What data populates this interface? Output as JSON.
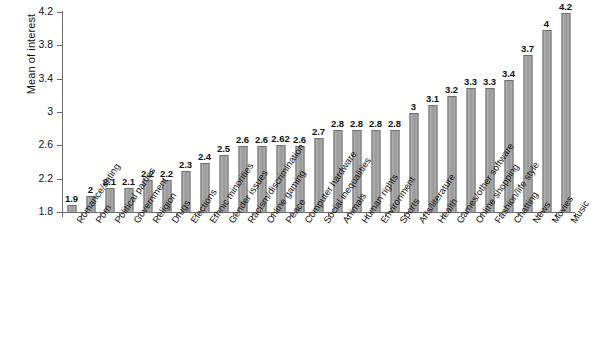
{
  "chart_data": {
    "type": "bar",
    "title": "",
    "xlabel": "",
    "ylabel": "Mean of interest",
    "ylim": [
      1.8,
      4.2
    ],
    "yticks": [
      "1.8",
      "2.2",
      "2.6",
      "3",
      "3.4",
      "3.8",
      "4.2"
    ],
    "ytick_values": [
      1.8,
      2.2,
      2.6,
      3.0,
      3.4,
      3.8,
      4.2
    ],
    "grid": false,
    "legend": null,
    "bar_color": "#a6a6a6",
    "bar_edge_color": "#6f6f6f",
    "axis_color": "#6b6b6b",
    "categories": [
      "Romance/dating",
      "Porn",
      "Political parties",
      "Government",
      "Religion",
      "Drugs",
      "Elections",
      "Ethnic minorities",
      "Gender issues",
      "Racism/discrimination",
      "Online gaming",
      "Peace",
      "Computer hardware",
      "Social inequalities",
      "Animals",
      "Human rights",
      "Environment",
      "Sports",
      "Arts/literature",
      "Health",
      "Games/other software",
      "Online shopping",
      "Fashion/life style",
      "Chatting",
      "News",
      "Movies",
      "Music"
    ],
    "values": [
      1.9,
      2.0,
      2.1,
      2.1,
      2.2,
      2.2,
      2.3,
      2.4,
      2.5,
      2.6,
      2.6,
      2.62,
      2.6,
      2.7,
      2.8,
      2.8,
      2.8,
      2.8,
      3.0,
      3.1,
      3.2,
      3.3,
      3.3,
      3.4,
      3.7,
      4.0,
      4.2
    ],
    "value_labels": [
      "1.9",
      "2",
      "2.1",
      "2.1",
      "2.2",
      "2.2",
      "2.3",
      "2.4",
      "2.5",
      "2.6",
      "2.6",
      "2.62",
      "2.6",
      "2.7",
      "2.8",
      "2.8",
      "2.8",
      "2.8",
      "3",
      "3.1",
      "3.2",
      "3.3",
      "3.3",
      "3.4",
      "3.7",
      "4",
      "4.2"
    ]
  }
}
